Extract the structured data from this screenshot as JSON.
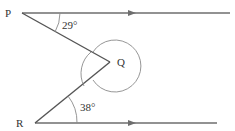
{
  "diagram": {
    "points": {
      "P": "P",
      "Q": "Q",
      "R": "R"
    },
    "angles": {
      "top": "29°",
      "bottom": "38°"
    },
    "colors": {
      "line": "#6e6e6e",
      "arc": "#8a8a8a",
      "text": "#333333"
    }
  }
}
